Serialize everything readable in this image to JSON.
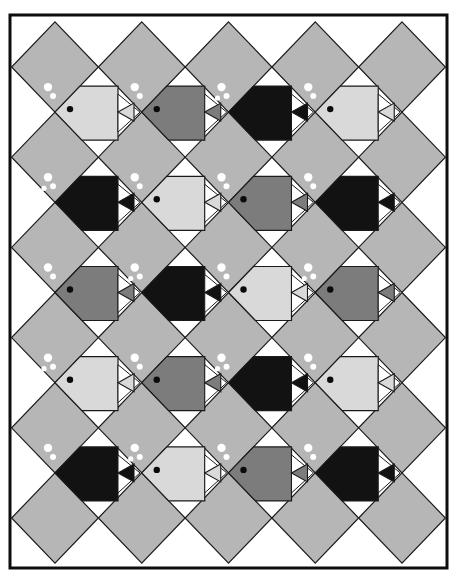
{
  "colors": {
    "background": "#ffffff",
    "diamond": "#b6b6b6",
    "outline": "#1a1a1a",
    "frame": "#0d0d0d",
    "bubble": "#ffffff",
    "eye": "#0a0a0a",
    "fish_light": "#d9d9d9",
    "fish_medium": "#7c7c7c",
    "fish_black": "#121212"
  },
  "frame": {
    "x": 10,
    "y": 15,
    "width": 437,
    "height": 553,
    "stroke": 3
  },
  "diamond_grid": {
    "cx0": 55,
    "dx": 86.75,
    "cols": 5,
    "cy0": 67,
    "dy": 90.2,
    "rows": 6,
    "half_w": 43.4,
    "half_h": 45.1
  },
  "fish_grid": {
    "cols": 4,
    "rows": [
      {
        "fish": [
          {
            "shade": "light",
            "bubbles": 2
          },
          {
            "shade": "medium",
            "bubbles": 2
          },
          {
            "shade": "black",
            "bubbles": 3
          },
          {
            "shade": "light",
            "bubbles": 2
          }
        ]
      },
      {
        "fish": [
          {
            "shade": "black",
            "bubbles": 3
          },
          {
            "shade": "light",
            "bubbles": 2
          },
          {
            "shade": "medium",
            "bubbles": 2
          },
          {
            "shade": "black",
            "bubbles": 2
          }
        ]
      },
      {
        "fish": [
          {
            "shade": "medium",
            "bubbles": 2
          },
          {
            "shade": "black",
            "bubbles": 3
          },
          {
            "shade": "light",
            "bubbles": 2
          },
          {
            "shade": "medium",
            "bubbles": 3
          }
        ]
      },
      {
        "fish": [
          {
            "shade": "light",
            "bubbles": 3
          },
          {
            "shade": "medium",
            "bubbles": 2
          },
          {
            "shade": "black",
            "bubbles": 3
          },
          {
            "shade": "light",
            "bubbles": 2
          }
        ]
      },
      {
        "fish": [
          {
            "shade": "black",
            "bubbles": 2
          },
          {
            "shade": "light",
            "bubbles": 3
          },
          {
            "shade": "medium",
            "bubbles": 2
          },
          {
            "shade": "black",
            "bubbles": 2
          }
        ]
      }
    ]
  }
}
